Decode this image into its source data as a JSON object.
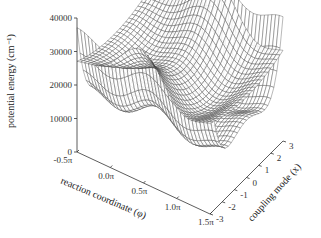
{
  "chart_data": {
    "type": "surface3d",
    "title": "",
    "zlabel": "potential energy (cm⁻¹)",
    "xlabel": "reaction coordinate (φ)",
    "ylabel": "coupling mode (x)",
    "z_ticks": [
      "0",
      "10000",
      "20000",
      "30000",
      "40000"
    ],
    "zlim": [
      0,
      40000
    ],
    "x_ticks": [
      "-0.5π",
      "0.0π",
      "0.5π",
      "1.0π",
      "1.5π"
    ],
    "xlim": [
      "-0.5π",
      "1.5π"
    ],
    "y_ticks": [
      "-3",
      "-2",
      "-1",
      "0",
      "1",
      "2",
      "3"
    ],
    "ylim": [
      -3,
      3
    ],
    "series": [
      {
        "name": "lower surface",
        "description": "double-well along x, periodic in φ; min ~12000 near φ=0.5π, x=±1.5"
      },
      {
        "name": "upper surface",
        "description": "peaks ~38000 at x=±3 near φ=1.0π; min ~20000 near x=0"
      }
    ],
    "grid": false,
    "legend": "none"
  },
  "axes": {
    "z_label": "potential energy (cm⁻¹)",
    "x_label": "reaction coordinate (φ)",
    "y_label": "coupling mode (x)"
  }
}
